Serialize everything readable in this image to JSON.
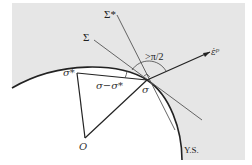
{
  "diagram": {
    "colors": {
      "background": "#ffffff",
      "outside_region": "#e6e6e6",
      "line": "#333333",
      "thin_line": "#555555"
    },
    "labels": {
      "sigma_star_plane": "Σ*",
      "sigma_plane": "Σ",
      "angle": ">π/2",
      "strain_rate": "ε̇ᵖ",
      "sigma_star": "σ*",
      "difference": "σ−σ*",
      "sigma": "σ",
      "origin": "O",
      "yield_surface": "Y.S."
    },
    "points": {
      "sigma": [
        147,
        80
      ],
      "sigma_star": [
        77,
        73
      ],
      "origin": [
        85,
        138
      ],
      "strain_rate_tip": [
        210,
        52
      ]
    }
  }
}
